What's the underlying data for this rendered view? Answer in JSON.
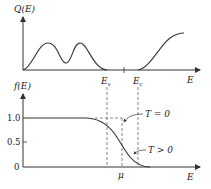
{
  "diagram": {
    "top_panel": {
      "y_label": "Q(E)",
      "x_label": "E",
      "x_marks": [
        {
          "label": "E",
          "subscript": "v"
        },
        {
          "label": "E",
          "subscript": "c"
        }
      ]
    },
    "bottom_panel": {
      "y_label": "f(E)",
      "x_label": "E",
      "y_ticks": [
        "1.0",
        "0.5",
        "0"
      ],
      "mu_label": "μ",
      "annotations": [
        {
          "label": "T = 0"
        },
        {
          "label": "T > 0"
        }
      ]
    },
    "colors": {
      "line": "#333333",
      "dash": "#555555"
    }
  }
}
